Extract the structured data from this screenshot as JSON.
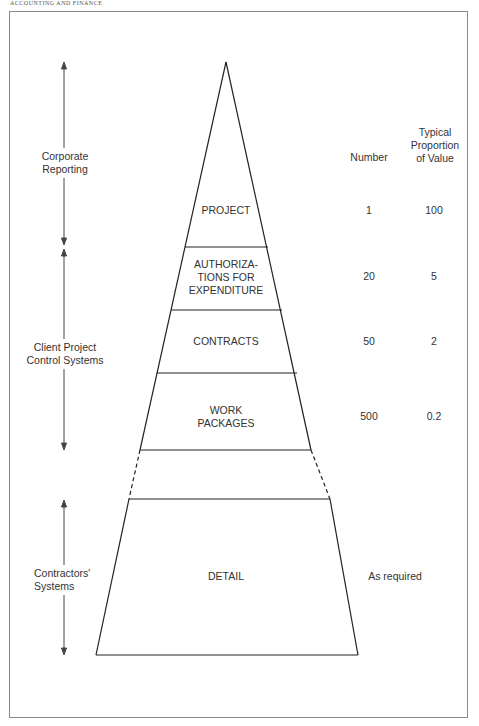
{
  "header": {
    "running_title": "ACCOUNTING AND FINANCE"
  },
  "columns": {
    "number": "Number",
    "proportion": "Typical\nProportion\nof Value"
  },
  "side_ranges": [
    {
      "label": "Corporate\nReporting",
      "y_top": 62,
      "y_bottom": 245
    },
    {
      "label": "Client Project\nControl Systems",
      "y_top": 249,
      "y_bottom": 450
    },
    {
      "label": "Contractors'\nSystems",
      "y_top": 500,
      "y_bottom": 655
    }
  ],
  "levels": [
    {
      "name": "PROJECT",
      "number": "1",
      "proportion": "100"
    },
    {
      "name": "AUTHORIZA-\nTIONS FOR\nEXPENDITURE",
      "number": "20",
      "proportion": "5"
    },
    {
      "name": "CONTRACTS",
      "number": "50",
      "proportion": "2"
    },
    {
      "name": "WORK\nPACKAGES",
      "number": "500",
      "proportion": "0.2"
    },
    {
      "name": "DETAIL",
      "number": "",
      "proportion": "As required"
    }
  ]
}
